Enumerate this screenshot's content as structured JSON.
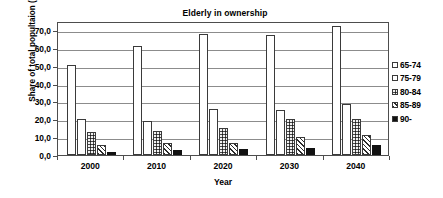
{
  "chart_data": {
    "type": "bar",
    "title": "Elderly in ownership",
    "xlabel": "Year",
    "ylabel": "Share of total popultaion (per 1000)",
    "categories": [
      "2000",
      "2010",
      "2020",
      "2030",
      "2040"
    ],
    "series": [
      {
        "name": "65-74",
        "values": [
          50.5,
          60.8,
          68.0,
          67.0,
          72.0
        ],
        "pattern": "white-outline"
      },
      {
        "name": "75-79",
        "values": [
          20.0,
          19.0,
          25.5,
          25.0,
          28.5
        ],
        "pattern": "fine-dots"
      },
      {
        "name": "80-84",
        "values": [
          13.0,
          13.5,
          15.0,
          20.3,
          20.0
        ],
        "pattern": "dark-speckle"
      },
      {
        "name": "85-89",
        "values": [
          5.5,
          7.0,
          7.0,
          10.2,
          11.0
        ],
        "pattern": "diagonal-hatch"
      },
      {
        "name": "90-",
        "values": [
          1.5,
          3.0,
          3.3,
          4.0,
          5.7
        ],
        "pattern": "solid-black"
      }
    ],
    "ylim": [
      0,
      75
    ],
    "yticks": [
      0,
      10,
      20,
      30,
      40,
      50,
      60,
      70
    ],
    "ytick_labels": [
      "0,0",
      "10,0",
      "20,0",
      "30,0",
      "40,0",
      "50,0",
      "60,0",
      "70,0"
    ],
    "grid": true,
    "legend_position": "right",
    "colors": {
      "axis": "#4d4d4d",
      "gridline": "#8c8c8c",
      "bar_outline": "#3a3a3a",
      "solid_fill": "#111111",
      "background": "#ffffff"
    }
  },
  "legend": {
    "items": [
      {
        "label": "65-74"
      },
      {
        "label": "75-79"
      },
      {
        "label": "80-84"
      },
      {
        "label": "85-89"
      },
      {
        "label": "90-"
      }
    ]
  }
}
